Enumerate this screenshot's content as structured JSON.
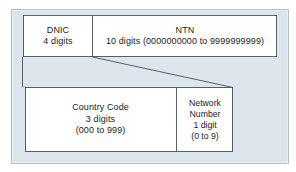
{
  "diagram": {
    "colors": {
      "panel_fill": "#dde5ec",
      "panel_border": "#b4bfc9",
      "box_fill": "#ffffff",
      "box_border": "#55606b",
      "text": "#1b1b1b"
    },
    "top_row": {
      "fields": [
        {
          "name": "dnic",
          "label": "DNIC",
          "detail": "4 digits"
        },
        {
          "name": "ntn",
          "label": "NTN",
          "detail": "10 digits (0000000000 to 9999999999)"
        }
      ]
    },
    "expansion": {
      "source_field": "dnic",
      "note": "DNIC expanded into Country Code and Network Number"
    },
    "bottom_row": {
      "fields": [
        {
          "name": "country-code",
          "label": "Country Code",
          "detail": "3 digits",
          "range": "(000 to 999)"
        },
        {
          "name": "network-number",
          "label": "Network",
          "label2": "Number",
          "detail": "1 digit",
          "range": "(0 to 9)"
        }
      ]
    }
  }
}
